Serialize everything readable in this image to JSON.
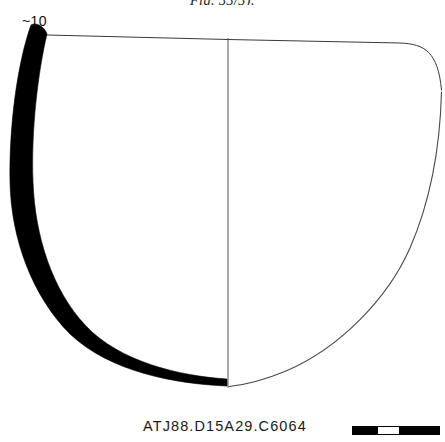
{
  "figure": {
    "top_caption": "Fig. 33/3).",
    "rim_diameter_label": "~10",
    "catalog_number": "ATJ88.D15A29.C6064",
    "ink_color": "#000000",
    "line_color": "#3a3a3a",
    "background_color": "#ffffff"
  },
  "scale_bar": {
    "name": "scale-bar",
    "segments": [
      {
        "fill": "dark",
        "width_pct": 30
      },
      {
        "fill": "light",
        "width_pct": 23
      },
      {
        "fill": "dark",
        "width_pct": 47
      }
    ]
  },
  "drawing": {
    "type": "archaeological-vessel-profile",
    "description": "Ceramic bowl profile: solid black section at left, thin reconstruction outline at right, horizontal rim line and vertical central axis.",
    "axis": {
      "vertical_x": 228,
      "vertical_y_top": 38,
      "vertical_y_bottom": 388
    },
    "rim_line": {
      "y_left": 35,
      "x_left": 47,
      "y_mid": 42,
      "x_right": 441,
      "y_right_drop": 88
    },
    "solid_profile_path": "M 30 26 C 14 78, 8 170, 16 236 C 24 300, 70 354, 120 378 L 226 386 L 226 378 C 140 358, 54 300, 32 230 C 18 168, 24 92, 44 36 Z",
    "thin_profile_path": "M 441 48 C 443 120, 436 184, 414 238 C 392 292, 330 346, 232 386",
    "thin_stroke_width": 1.1,
    "rim_stroke_width": 1.0,
    "axis_stroke_width": 1.0
  }
}
